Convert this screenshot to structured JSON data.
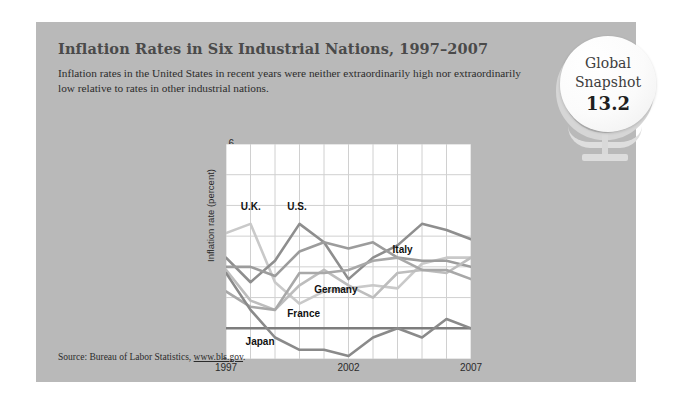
{
  "panel": {
    "title": "Inflation Rates in Six Industrial Nations, 1997–2007",
    "subtitle": "Inflation rates in the United States in recent years were neither extraordinarily high nor extraordinarily low relative to rates in other industrial nations.",
    "background_color": "#b9b9b9"
  },
  "badge": {
    "line1": "Global",
    "line2": "Snapshot",
    "number": "13.2",
    "icon": "globe-icon"
  },
  "source": {
    "prefix": "Source: Bureau of Labor Statistics, ",
    "link_text": "www.bls.gov",
    "suffix": "."
  },
  "chart_data": {
    "type": "line",
    "title": "Inflation Rates in Six Industrial Nations, 1997–2007",
    "xlabel": "",
    "ylabel": "Inflation rate (percent)",
    "x": [
      1997,
      1998,
      1999,
      2000,
      2001,
      2002,
      2003,
      2004,
      2005,
      2006,
      2007
    ],
    "xlim": [
      1997,
      2007
    ],
    "ylim": [
      -1,
      6
    ],
    "yticks": [
      6,
      5,
      4,
      3,
      2,
      1,
      0,
      -1
    ],
    "xticks": [
      1997,
      2002,
      2007
    ],
    "xtick_labels": [
      "1997",
      "2002",
      "2007"
    ],
    "grid": true,
    "legend": "inline-labels",
    "series": [
      {
        "name": "U.K.",
        "color": "#c9c9c9",
        "values": [
          3.1,
          3.4,
          1.5,
          0.8,
          1.2,
          1.3,
          1.4,
          1.3,
          2.1,
          2.3,
          2.3
        ]
      },
      {
        "name": "U.S.",
        "color": "#8e8e8e",
        "values": [
          2.3,
          1.5,
          2.2,
          3.4,
          2.8,
          1.6,
          2.3,
          2.7,
          3.4,
          3.2,
          2.9
        ]
      },
      {
        "name": "Italy",
        "color": "#9c9c9c",
        "values": [
          2.0,
          2.0,
          1.7,
          2.5,
          2.8,
          2.6,
          2.8,
          2.3,
          2.2,
          2.2,
          2.0
        ]
      },
      {
        "name": "Germany",
        "color": "#bdbdbd",
        "values": [
          1.9,
          0.9,
          0.6,
          1.4,
          1.9,
          1.4,
          1.0,
          1.8,
          1.9,
          1.8,
          2.3
        ]
      },
      {
        "name": "France",
        "color": "#a8a8a8",
        "values": [
          1.2,
          0.7,
          0.6,
          1.8,
          1.8,
          1.9,
          2.2,
          2.3,
          1.9,
          1.9,
          1.6
        ]
      },
      {
        "name": "Japan",
        "color": "#8a8a8a",
        "values": [
          1.8,
          0.6,
          -0.3,
          -0.7,
          -0.7,
          -0.9,
          -0.3,
          0.0,
          -0.3,
          0.3,
          0.0
        ]
      }
    ],
    "inline_labels": [
      {
        "text": "U.K.",
        "x": 1997.6,
        "y": 3.95
      },
      {
        "text": "U.S.",
        "x": 1999.5,
        "y": 3.95
      },
      {
        "text": "Italy",
        "x": 2003.8,
        "y": 2.55
      },
      {
        "text": "Germany",
        "x": 2000.6,
        "y": 1.25
      },
      {
        "text": "France",
        "x": 1999.5,
        "y": 0.45
      },
      {
        "text": "Japan",
        "x": 1997.8,
        "y": -0.45
      }
    ]
  }
}
